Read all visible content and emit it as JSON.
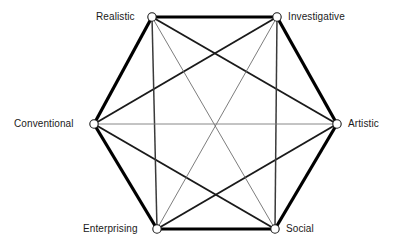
{
  "diagram": {
    "type": "hexagon-network",
    "background_color": "#ffffff",
    "node_fill_color": "#ffffff",
    "node_stroke_color": "#1a1a1a",
    "perimeter_color": "#000000",
    "diagonal_color": "#1a1a1a",
    "thin_diagonal_color": "#6e6e6e",
    "nodes": [
      {
        "id": "realistic",
        "label": "Realistic",
        "x": 152,
        "y": 17,
        "label_side": "left",
        "label_x": 96,
        "label_y": 11
      },
      {
        "id": "investigative",
        "label": "Investigative",
        "x": 277,
        "y": 17,
        "label_side": "right",
        "label_x": 288,
        "label_y": 11
      },
      {
        "id": "artistic",
        "label": "Artistic",
        "x": 337,
        "y": 124,
        "label_side": "right",
        "label_x": 348,
        "label_y": 118
      },
      {
        "id": "social",
        "label": "Social",
        "x": 275,
        "y": 229,
        "label_side": "right",
        "label_x": 286,
        "label_y": 223
      },
      {
        "id": "enterprising",
        "label": "Enterprising",
        "x": 157,
        "y": 229,
        "label_side": "left",
        "label_x": 83,
        "label_y": 223
      },
      {
        "id": "conventional",
        "label": "Conventional",
        "x": 94,
        "y": 124,
        "label_side": "left",
        "label_x": 14,
        "label_y": 118
      }
    ],
    "edges": [
      {
        "from": "realistic",
        "to": "investigative",
        "weight": "thick",
        "stroke_width": 3.2,
        "color": "#000000"
      },
      {
        "from": "investigative",
        "to": "artistic",
        "weight": "thick",
        "stroke_width": 3.2,
        "color": "#000000"
      },
      {
        "from": "artistic",
        "to": "social",
        "weight": "thick",
        "stroke_width": 3.2,
        "color": "#000000"
      },
      {
        "from": "social",
        "to": "enterprising",
        "weight": "thick",
        "stroke_width": 3.2,
        "color": "#000000"
      },
      {
        "from": "enterprising",
        "to": "conventional",
        "weight": "thick",
        "stroke_width": 3.2,
        "color": "#000000"
      },
      {
        "from": "conventional",
        "to": "realistic",
        "weight": "thick",
        "stroke_width": 3.2,
        "color": "#000000"
      },
      {
        "from": "realistic",
        "to": "artistic",
        "weight": "medium",
        "stroke_width": 1.9,
        "color": "#1a1a1a"
      },
      {
        "from": "conventional",
        "to": "investigative",
        "weight": "medium",
        "stroke_width": 1.9,
        "color": "#1a1a1a"
      },
      {
        "from": "enterprising",
        "to": "artistic",
        "weight": "medium",
        "stroke_width": 1.9,
        "color": "#1a1a1a"
      },
      {
        "from": "conventional",
        "to": "social",
        "weight": "medium",
        "stroke_width": 1.9,
        "color": "#1a1a1a"
      },
      {
        "from": "realistic",
        "to": "enterprising",
        "weight": "medium",
        "stroke_width": 1.5,
        "color": "#3a3a3a"
      },
      {
        "from": "investigative",
        "to": "social",
        "weight": "medium",
        "stroke_width": 1.5,
        "color": "#3a3a3a"
      },
      {
        "from": "realistic",
        "to": "social",
        "weight": "thin",
        "stroke_width": 0.9,
        "color": "#6e6e6e"
      },
      {
        "from": "investigative",
        "to": "enterprising",
        "weight": "thin",
        "stroke_width": 0.9,
        "color": "#6e6e6e"
      },
      {
        "from": "conventional",
        "to": "artistic",
        "weight": "thin",
        "stroke_width": 0.9,
        "color": "#7a7a7a"
      }
    ],
    "node_radius": 4.2,
    "node_stroke_width": 1.1
  }
}
